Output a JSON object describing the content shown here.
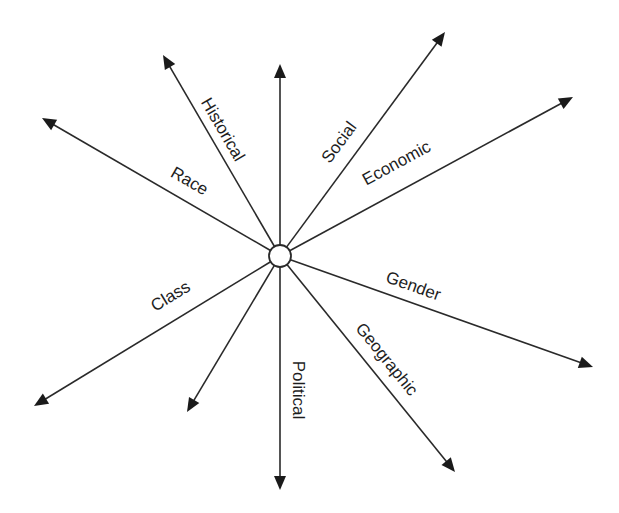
{
  "diagram": {
    "type": "radial-arrows",
    "colors": {
      "line": "#2a2a2a",
      "arrowhead": "#1a1a1a",
      "text": "#1e1e1e",
      "background": "#ffffff",
      "hub_fill": "#ffffff"
    },
    "hub": {
      "cx": 280,
      "cy": 256,
      "r": 11
    },
    "arrows": [
      {
        "id": "historical",
        "label": "Historical",
        "tip": [
          163,
          55
        ],
        "label_pos": [
          222,
          130
        ],
        "label_angle": 59.8
      },
      {
        "id": "up-unlabeled",
        "label": "",
        "tip": [
          280,
          64
        ],
        "label_pos": [
          0,
          0
        ],
        "label_angle": 0
      },
      {
        "id": "race",
        "label": "Race",
        "tip": [
          42,
          118
        ],
        "label_pos": [
          189,
          182
        ],
        "label_angle": 30.1
      },
      {
        "id": "social",
        "label": "Social",
        "tip": [
          445,
          32
        ],
        "label_pos": [
          340,
          143
        ],
        "label_angle": -53.6
      },
      {
        "id": "economic",
        "label": "Economic",
        "tip": [
          573,
          97
        ],
        "label_pos": [
          397,
          164
        ],
        "label_angle": -28.5
      },
      {
        "id": "class",
        "label": "Class",
        "tip": [
          34,
          406
        ],
        "label_pos": [
          171,
          297
        ],
        "label_angle": -31.4
      },
      {
        "id": "down-left-unlabeled",
        "label": "",
        "tip": [
          187,
          412
        ],
        "label_pos": [
          0,
          0
        ],
        "label_angle": 0
      },
      {
        "id": "political",
        "label": "Political",
        "tip": [
          280,
          490
        ],
        "label_pos": [
          297,
          390
        ],
        "label_angle": 90
      },
      {
        "id": "gender",
        "label": "Gender",
        "tip": [
          593,
          367
        ],
        "label_pos": [
          413,
          287
        ],
        "label_angle": 19.5
      },
      {
        "id": "geographic",
        "label": "Geographic",
        "tip": [
          455,
          472
        ],
        "label_pos": [
          386,
          360
        ],
        "label_angle": 51
      }
    ]
  }
}
